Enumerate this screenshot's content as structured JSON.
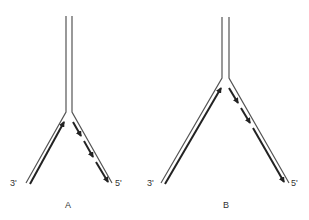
{
  "diagram": {
    "type": "replication-fork",
    "colors": {
      "strand": "#555555",
      "new_strand": "#222222",
      "label": "#333333"
    },
    "panels": [
      {
        "label": "A",
        "left_end_label": "3'",
        "right_end_label": "5'",
        "left_arm": "continuous leading strand synthesis toward fork",
        "right_arm": "discontinuous lagging strand fragments away from fork"
      },
      {
        "label": "B",
        "left_end_label": "3'",
        "right_end_label": "5'",
        "left_arm": "continuous leading strand synthesis toward fork",
        "right_arm": "discontinuous lagging strand fragments away from fork (longer fragments)"
      }
    ]
  }
}
